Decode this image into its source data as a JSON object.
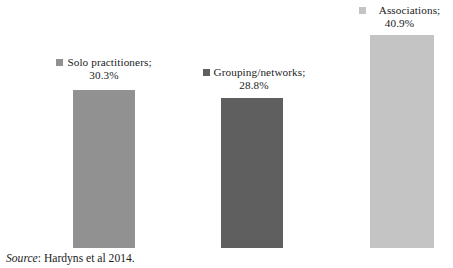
{
  "chart_data": {
    "type": "bar",
    "title": "",
    "subtitle": "",
    "xlabel": "",
    "ylabel": "",
    "grid": false,
    "axes_visible": false,
    "legend_position": "above-each-bar",
    "value_suffix": "%",
    "ylim": [
      0,
      40.9
    ],
    "categories": [
      "Solo practitioners",
      "Grouping/networks",
      "Associations"
    ],
    "values": [
      30.3,
      28.8,
      40.9
    ],
    "value_labels": [
      "30.3%",
      "28.8%",
      "40.9%"
    ],
    "colors": [
      "#919191",
      "#5f5f5f",
      "#c4c4c4"
    ],
    "series": [
      {
        "name": "Share of respondents",
        "values": [
          30.3,
          28.8,
          40.9
        ]
      }
    ],
    "points": [
      {
        "category": "Solo practitioners",
        "value": 30.3,
        "label_line1": "Solo practitioners;",
        "label_line2": "30.3%",
        "color": "#919191"
      },
      {
        "category": "Grouping/networks",
        "value": 28.8,
        "label_line1": "Grouping/networks;",
        "label_line2": "28.8%",
        "color": "#5f5f5f"
      },
      {
        "category": "Associations",
        "value": 40.9,
        "label_line1": "Associations;",
        "label_line2": "40.9%",
        "color": "#c4c4c4"
      }
    ]
  },
  "source_note": {
    "prefix": "Source",
    "separator": ": ",
    "text": "Hardyns et al 2014."
  }
}
